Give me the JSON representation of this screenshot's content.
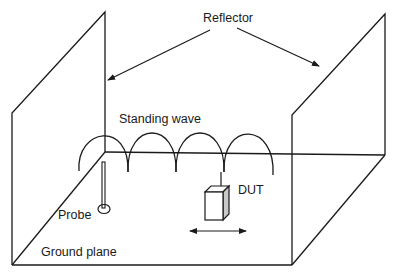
{
  "diagram": {
    "labels": {
      "reflector": "Reflector",
      "standing_wave": "Standing wave",
      "dut": "DUT",
      "probe": "Probe",
      "ground_plane": "Ground plane"
    },
    "colors": {
      "line": "#1a1a1a",
      "background": "#ffffff",
      "dut_side": "#c8c8c8"
    },
    "components": [
      {
        "id": "left-reflector",
        "type": "wall"
      },
      {
        "id": "right-reflector",
        "type": "wall"
      },
      {
        "id": "ground-plane",
        "type": "floor"
      },
      {
        "id": "standing-wave",
        "type": "wave",
        "lobes": 4
      },
      {
        "id": "probe",
        "type": "probe"
      },
      {
        "id": "dut",
        "type": "box",
        "movement": "horizontal-bidirectional"
      }
    ]
  }
}
